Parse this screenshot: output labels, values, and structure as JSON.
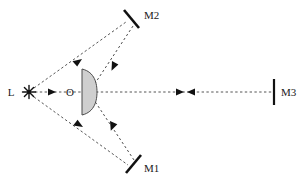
{
  "figure": {
    "background_color": "#ffffff",
    "ray_color": "#555555",
    "element_color": "#1a1a1a",
    "lens_fill_color": "#cccccc"
  },
  "labels": {
    "source": "L",
    "lens_center": "O",
    "mirror_top": "M2",
    "mirror_bottom": "M1",
    "mirror_right": "M3"
  },
  "components": [
    {
      "id": "light-source",
      "name": "L",
      "type": "point-source",
      "icon": "starburst-icon",
      "x": 29,
      "y": 92
    },
    {
      "id": "lens",
      "name": "O",
      "type": "plano-convex-lens",
      "x": 82,
      "y": 92,
      "flat_edge": "left",
      "curved_edge": "right",
      "half_height": 23,
      "bulge": 14
    },
    {
      "id": "mirror-m2",
      "name": "M2",
      "type": "plane-mirror",
      "orientation": "tilted-backslash",
      "x1": 124,
      "y1": 11,
      "x2": 139,
      "y2": 27
    },
    {
      "id": "mirror-m1",
      "name": "M1",
      "type": "plane-mirror",
      "orientation": "tilted-slash",
      "x1": 126,
      "y1": 172,
      "x2": 141,
      "y2": 156
    },
    {
      "id": "mirror-m3",
      "name": "M3",
      "type": "plane-mirror",
      "orientation": "vertical",
      "x1": 274,
      "y1": 80,
      "x2": 274,
      "y2": 104
    }
  ],
  "rays": [
    {
      "id": "ray-axis-source-to-lens",
      "from": "L",
      "to": "O",
      "style": "dashed",
      "arrows": [
        {
          "at": 0.62,
          "direction": "right"
        }
      ]
    },
    {
      "id": "ray-lens-to-m3",
      "from": "lens",
      "to": "M3",
      "style": "dashed",
      "arrows": [
        {
          "at": 0.42,
          "direction": "right"
        },
        {
          "at": 0.5,
          "direction": "left"
        }
      ]
    },
    {
      "id": "ray-source-to-m2",
      "from": "L",
      "to": "M2",
      "style": "dashed",
      "arrows": [
        {
          "at": 0.55,
          "direction": "up-right"
        }
      ]
    },
    {
      "id": "ray-m2-to-lens",
      "from": "M2",
      "to": "lens",
      "style": "dashed",
      "arrows": [
        {
          "at": 0.45,
          "direction": "down-left"
        }
      ]
    },
    {
      "id": "ray-source-to-m1",
      "from": "L",
      "to": "M1",
      "style": "dashed",
      "arrows": [
        {
          "at": 0.5,
          "direction": "down-right"
        }
      ]
    },
    {
      "id": "ray-m1-to-lens",
      "from": "M1",
      "to": "lens",
      "style": "dashed",
      "arrows": [
        {
          "at": 0.55,
          "direction": "up-left"
        }
      ]
    }
  ]
}
